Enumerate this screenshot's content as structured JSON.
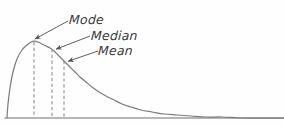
{
  "figure": {
    "background_color": "#fefefe",
    "curve_color": "#7d7d7d",
    "axis_color": "#6e6e6e",
    "dashed_line_color": "#8c8c8c",
    "arrow_color": "#555555",
    "text_color": "#3a3a3a"
  },
  "annotations": [
    {
      "id": "mode",
      "label": "Mode",
      "label_x": 69,
      "label_y": 14,
      "arrow_from_x": 68,
      "arrow_from_y": 21,
      "arrow_to_x": 33,
      "arrow_to_y": 40,
      "marker_x": 34,
      "marker_y_top": 42,
      "marker_y_bottom": 118
    },
    {
      "id": "median",
      "label": "Median",
      "label_x": 91,
      "label_y": 30,
      "arrow_from_x": 90,
      "arrow_from_y": 36,
      "arrow_to_x": 54,
      "arrow_to_y": 50,
      "marker_x": 52,
      "marker_y_top": 49,
      "marker_y_bottom": 118
    },
    {
      "id": "mean",
      "label": "Mean",
      "label_x": 98,
      "label_y": 45,
      "arrow_from_x": 98,
      "arrow_from_y": 51,
      "arrow_to_x": 66,
      "arrow_to_y": 62,
      "marker_x": 64,
      "marker_y_top": 61,
      "marker_y_bottom": 118
    }
  ],
  "chart_data": {
    "type": "line",
    "title": "",
    "xlabel": "",
    "ylabel": "",
    "grid": false,
    "legend": "none",
    "axis": {
      "baseline_y": 118,
      "baseline_x_start": 5,
      "baseline_x_end": 284
    },
    "series": [
      {
        "name": "Right-skewed density curve",
        "points": [
          [
            7,
            118
          ],
          [
            8,
            104
          ],
          [
            10,
            88
          ],
          [
            13,
            72
          ],
          [
            17,
            59
          ],
          [
            22,
            50
          ],
          [
            27,
            45
          ],
          [
            31,
            42
          ],
          [
            34,
            41
          ],
          [
            38,
            42
          ],
          [
            42,
            44
          ],
          [
            46,
            46
          ],
          [
            50,
            48
          ],
          [
            54,
            51
          ],
          [
            58,
            55
          ],
          [
            62,
            59
          ],
          [
            66,
            63
          ],
          [
            70,
            67
          ],
          [
            75,
            72
          ],
          [
            80,
            77
          ],
          [
            86,
            82
          ],
          [
            92,
            87
          ],
          [
            99,
            92
          ],
          [
            106,
            96
          ],
          [
            114,
            100
          ],
          [
            122,
            104
          ],
          [
            131,
            107
          ],
          [
            141,
            110
          ],
          [
            152,
            112
          ],
          [
            164,
            114
          ],
          [
            177,
            115
          ],
          [
            191,
            116
          ],
          [
            206,
            117
          ],
          [
            222,
            117
          ],
          [
            240,
            118
          ],
          [
            262,
            118
          ],
          [
            284,
            118
          ]
        ]
      }
    ],
    "markers": [
      {
        "label": "Mode",
        "x": 34,
        "curve_y": 42
      },
      {
        "label": "Median",
        "x": 52,
        "curve_y": 49
      },
      {
        "label": "Mean",
        "x": 64,
        "curve_y": 61
      }
    ]
  }
}
